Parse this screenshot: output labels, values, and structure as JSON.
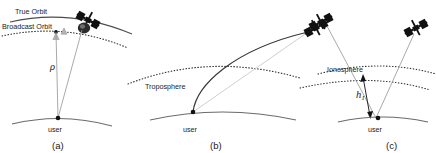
{
  "figure": {
    "type": "scientific-diagram",
    "background_color": "#ffffff",
    "line_color": "#4d4d4d",
    "dark_line_color": "#333333",
    "faint_line_color": "#b8b8b8",
    "satellite_color": "#111111",
    "text_color": "#1a1a1a"
  },
  "panels": [
    {
      "id": "a",
      "caption": "(a)",
      "labels": {
        "true_orbit": "True Orbit",
        "broadcast_orbit": "Broadcast Orbit",
        "range_symbol": "ρ",
        "user": "user"
      },
      "icons": {
        "satellite": "satellite-icon",
        "user_point": "user-marker-icon",
        "orbit_marker": "orbit-position-marker-icon"
      }
    },
    {
      "id": "b",
      "caption": "(b)",
      "labels": {
        "troposphere": "Troposphere",
        "user": "user"
      },
      "icons": {
        "satellite": "satellite-icon",
        "user_point": "user-marker-icon"
      }
    },
    {
      "id": "c",
      "caption": "(c)",
      "labels": {
        "ionosphere": "Ionosphere",
        "height_symbol": "h",
        "height_subscript": "I",
        "user": "user"
      },
      "icons": {
        "satellite": "satellite-icon",
        "user_point": "user-marker-icon",
        "height_arrow": "double-arrow-icon"
      }
    }
  ]
}
